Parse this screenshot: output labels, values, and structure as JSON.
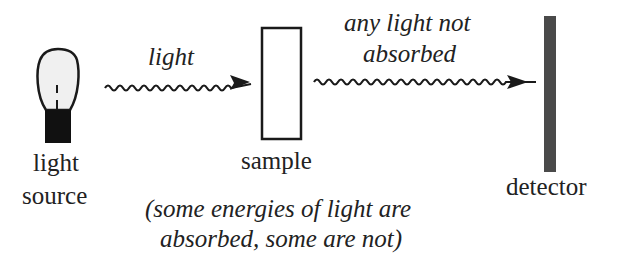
{
  "diagram": {
    "source": {
      "line1": "light",
      "line2": "source"
    },
    "incoming_label": "light",
    "sample_label": "sample",
    "outgoing_label": {
      "line1": "any light not",
      "line2": "absorbed"
    },
    "detector_label": "detector",
    "caption": {
      "line1": "(some energies of light are",
      "line2": "absorbed, some are not)"
    }
  },
  "colors": {
    "ink": "#1a1a1a",
    "detector": "#4a4a4a",
    "bulb_glass": "#f0f0f0"
  }
}
